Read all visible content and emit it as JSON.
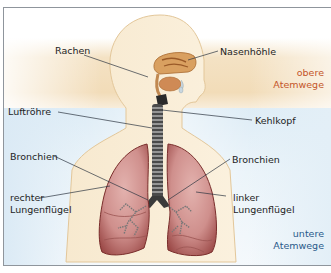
{
  "diagram": {
    "type": "anatomy",
    "labels": {
      "rachen": "Rachen",
      "nasenhoehle": "Nasenhöhle",
      "luftroehre": "Luftröhre",
      "kehlkopf": "Kehlkopf",
      "bronchien_left": "Bronchien",
      "bronchien_right": "Bronchien",
      "rechter_1": "rechter",
      "rechter_2": "Lungenflügel",
      "linker_1": "linker",
      "linker_2": "Lungenflügel"
    },
    "zones": {
      "upper_1": "obere",
      "upper_2": "Atemwege",
      "lower_1": "untere",
      "lower_2": "Atemwege"
    },
    "colors": {
      "upper_zone": "#c4562a",
      "lower_zone": "#2a5a8a",
      "upper_band": "#f2dcb8",
      "lower_band": "#d6e8f4",
      "body": "#f8ecd4",
      "lung": "#c98a88",
      "frame": "#8f959c"
    }
  }
}
